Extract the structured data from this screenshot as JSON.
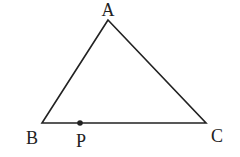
{
  "diagram": {
    "type": "triangle",
    "stroke_color": "#222222",
    "background": "#ffffff",
    "vertices": {
      "A": {
        "label": "A",
        "x": 108,
        "y": 20,
        "label_x": 108,
        "label_y": 16
      },
      "B": {
        "label": "B",
        "x": 42,
        "y": 123,
        "label_x": 32,
        "label_y": 144
      },
      "C": {
        "label": "C",
        "x": 206,
        "y": 123,
        "label_x": 217,
        "label_y": 142
      }
    },
    "points": [
      {
        "label": "P",
        "on_segment": "BC",
        "x": 80,
        "y": 123,
        "label_x": 81,
        "label_y": 147
      }
    ]
  }
}
